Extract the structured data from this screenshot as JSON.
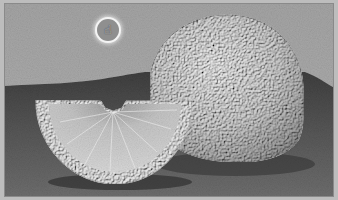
{
  "image": {
    "description": "Grayscale photograph of a whole orange with a half-moon orange wedge in front, on a dark tabletop against a light gray backdrop",
    "subjects": [
      "whole-orange",
      "orange-wedge"
    ],
    "colors": {
      "backdrop": "#a9a9a9",
      "tabletop": "#545454",
      "orange_peel": "#d6d6d6",
      "wedge_flesh": "#c9c9c9",
      "wedge_rind": "#ececec",
      "frame": "#bdbdbd"
    }
  },
  "cursor": {
    "icon": "hand-pointer-icon",
    "glyph": "☝",
    "x": 104,
    "y": 26
  }
}
